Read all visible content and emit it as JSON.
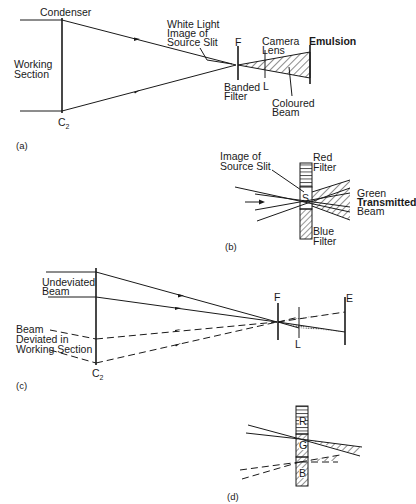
{
  "figure": {
    "panel_a": {
      "caption": "(a)",
      "labels": {
        "condenser": "Condenser",
        "working_section_1": "Working",
        "working_section_2": "Section",
        "c2": "C",
        "c2_sub": "2",
        "slit_1": "White Light",
        "slit_2": "Image of",
        "slit_3": "Source Slit",
        "f": "F",
        "banded_1": "Banded",
        "banded_2": "Filter",
        "camera_1": "Camera",
        "camera_2": "Lens",
        "l": "L",
        "emulsion": "Emulsion",
        "coloured_1": "Coloured",
        "coloured_2": "Beam"
      }
    },
    "panel_b": {
      "caption": "(b)",
      "labels": {
        "slit_1": "Image of",
        "slit_2": "Source Slit",
        "red_1": "Red",
        "red_2": "Filter",
        "s": "S",
        "green_1": "Green",
        "green_2": "Transmitted",
        "green_3": "Beam",
        "blue_1": "Blue",
        "blue_2": "Filter"
      }
    },
    "panel_c": {
      "caption": "(c)",
      "labels": {
        "undeviated_1": "Undeviated",
        "undeviated_2": "Beam",
        "deviated_1": "Beam",
        "deviated_2": "Deviated in",
        "deviated_3": "Working Section",
        "c2": "C",
        "c2_sub": "2",
        "f": "F",
        "l": "L",
        "e": "E"
      }
    },
    "panel_d": {
      "caption": "(d)",
      "labels": {
        "r": "R",
        "g": "G",
        "b": "B"
      }
    }
  }
}
